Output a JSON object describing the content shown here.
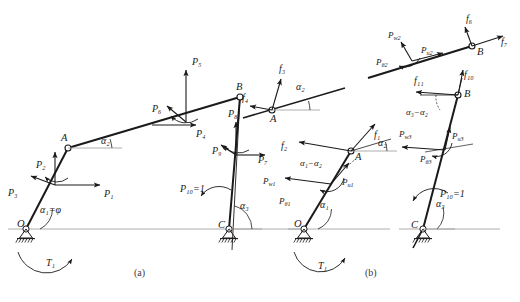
{
  "figure": {
    "background_color": "#ffffff",
    "line_color": "#1a1a1a",
    "ground_line_color": "#8a8a8a",
    "width": 520,
    "height": 302,
    "captions": [
      {
        "id": "caption-a",
        "text": "(a)",
        "x": 140,
        "y": 273
      },
      {
        "id": "caption-b",
        "text": "(b)",
        "x": 371,
        "y": 273
      }
    ]
  },
  "panel_a": {
    "id": "panel-a",
    "nodes": [
      {
        "name": "O",
        "label": "O",
        "x": 26,
        "y": 229,
        "support": "pin"
      },
      {
        "name": "A",
        "label": "A",
        "x": 68,
        "y": 148,
        "support": "none"
      },
      {
        "name": "B",
        "label": "B",
        "x": 240,
        "y": 97,
        "support": "none"
      },
      {
        "name": "C",
        "label": "C",
        "x": 229,
        "y": 229,
        "support": "pin"
      }
    ],
    "angles": [
      {
        "name": "alpha1",
        "text": "α₁=φ",
        "x": 40,
        "y": 212
      },
      {
        "name": "alpha2",
        "text": "α₂",
        "x": 101,
        "y": 143
      },
      {
        "name": "alpha3",
        "text": "α₃",
        "x": 240,
        "y": 208
      }
    ],
    "forces": [
      {
        "name": "P1",
        "text": "P₁",
        "x": 104,
        "y": 199
      },
      {
        "name": "P2",
        "text": "P₂",
        "x": 39,
        "y": 168
      },
      {
        "name": "P3",
        "text": "P₃",
        "x": 13,
        "y": 196
      },
      {
        "name": "P4",
        "text": "P₄",
        "x": 199,
        "y": 133
      },
      {
        "name": "P5",
        "text": "P₅",
        "x": 196,
        "y": 60
      },
      {
        "name": "P6",
        "text": "P₆",
        "x": 157,
        "y": 111
      },
      {
        "name": "P7",
        "text": "P₇",
        "x": 259,
        "y": 162
      },
      {
        "name": "P8",
        "text": "P₈",
        "x": 232,
        "y": 115
      },
      {
        "name": "P9",
        "text": "P₉",
        "x": 218,
        "y": 153
      },
      {
        "name": "P10",
        "text": "P₁₀=1",
        "x": 186,
        "y": 191
      }
    ],
    "torque": {
      "name": "T1",
      "text": "T₁",
      "x": 48,
      "y": 263
    }
  },
  "panel_b": {
    "id": "panel-b",
    "groups": [
      {
        "name": "bar1-free-body",
        "nodes": [
          {
            "name": "O",
            "label": "O",
            "x": 304,
            "y": 229,
            "support": "pin"
          },
          {
            "name": "A",
            "label": "A",
            "x": 351,
            "y": 151,
            "support": "none"
          }
        ],
        "angles": [
          {
            "name": "alpha1",
            "text": "α₁",
            "x": 320,
            "y": 207
          },
          {
            "name": "alpha2",
            "text": "α₂",
            "x": 379,
            "y": 145
          },
          {
            "name": "alpha1-alpha2",
            "text": "α₁−α₂",
            "x": 306,
            "y": 165
          }
        ],
        "forces": [
          {
            "name": "f1",
            "text": "f₁",
            "x": 377,
            "y": 137
          },
          {
            "name": "f2",
            "text": "f₂",
            "x": 285,
            "y": 148
          },
          {
            "name": "Pu1",
            "text": "P",
            "sub": "u1",
            "x": 345,
            "y": 185
          },
          {
            "name": "Pw1",
            "text": "P",
            "sub": "w1",
            "x": 268,
            "y": 184
          },
          {
            "name": "Ptheta1",
            "text": "P",
            "sub": "θ1",
            "x": 283,
            "y": 204
          }
        ],
        "torque": {
          "name": "T1",
          "text": "T₁",
          "x": 320,
          "y": 266
        }
      },
      {
        "name": "bar2-free-body",
        "nodes": [
          {
            "name": "A",
            "label": "A",
            "x": 272,
            "y": 110,
            "support": "none"
          }
        ],
        "angles": [
          {
            "name": "alpha2",
            "text": "α₂",
            "x": 297,
            "y": 89
          }
        ],
        "forces": [
          {
            "name": "f3",
            "text": "f₃",
            "x": 276,
            "y": 72
          },
          {
            "name": "f4",
            "text": "f₄",
            "x": 248,
            "y": 99
          }
        ]
      },
      {
        "name": "bar2-upper-free-body",
        "nodes": [
          {
            "name": "B",
            "label": "B",
            "x": 472,
            "y": 46,
            "support": "none"
          }
        ],
        "forces": [
          {
            "name": "f6",
            "text": "f₆",
            "x": 470,
            "y": 22
          },
          {
            "name": "f7",
            "text": "f₇",
            "x": 497,
            "y": 45
          },
          {
            "name": "Pu2",
            "text": "P",
            "sub": "u2",
            "x": 424,
            "y": 54
          },
          {
            "name": "Pw2",
            "text": "P",
            "sub": "w2",
            "x": 392,
            "y": 38
          },
          {
            "name": "Ptheta2",
            "text": "P",
            "sub": "θ2",
            "x": 381,
            "y": 65
          }
        ]
      },
      {
        "name": "bar3-free-body",
        "nodes": [
          {
            "name": "B",
            "label": "B",
            "x": 458,
            "y": 95,
            "support": "none"
          },
          {
            "name": "C",
            "label": "C",
            "x": 423,
            "y": 229,
            "support": "pin"
          }
        ],
        "angles": [
          {
            "name": "alpha3-alpha2",
            "text": "α₃−α₂",
            "x": 413,
            "y": 114
          },
          {
            "name": "alpha3",
            "text": "α₃",
            "x": 436,
            "y": 206
          }
        ],
        "forces": [
          {
            "name": "f10",
            "text": "f₁₀",
            "x": 466,
            "y": 78
          },
          {
            "name": "f11",
            "text": "f₁₁",
            "x": 418,
            "y": 83
          },
          {
            "name": "Pu3",
            "text": "P",
            "sub": "u3",
            "x": 455,
            "y": 139
          },
          {
            "name": "Pw3",
            "text": "P",
            "sub": "w3",
            "x": 404,
            "y": 137
          },
          {
            "name": "Ptheta3",
            "text": "P",
            "sub": "θ3",
            "x": 424,
            "y": 162
          },
          {
            "name": "P10",
            "text": "P₁₀=1",
            "x": 444,
            "y": 196
          }
        ]
      }
    ]
  }
}
